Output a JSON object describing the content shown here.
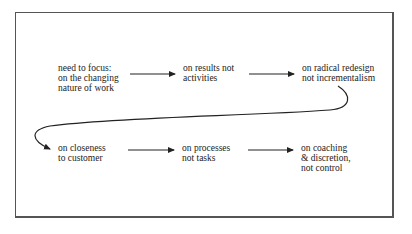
{
  "diagram": {
    "type": "flow",
    "rows": [
      {
        "nodes": [
          {
            "id": "n1",
            "lines": [
              "need to focus:",
              "on the changing",
              "nature of work"
            ]
          },
          {
            "id": "n2",
            "lines": [
              "on results not",
              "activities"
            ]
          },
          {
            "id": "n3",
            "lines": [
              "on radical redesign",
              "not incrementalism"
            ]
          }
        ]
      },
      {
        "nodes": [
          {
            "id": "n4",
            "lines": [
              "on closeness",
              "to customer"
            ]
          },
          {
            "id": "n5",
            "lines": [
              "on processes",
              "not tasks"
            ]
          },
          {
            "id": "n6",
            "lines": [
              "on coaching",
              "& discretion,",
              "not control"
            ]
          }
        ]
      }
    ],
    "edges": [
      {
        "from": "n1",
        "to": "n2",
        "style": "straight"
      },
      {
        "from": "n2",
        "to": "n3",
        "style": "straight"
      },
      {
        "from": "n3",
        "to": "n4",
        "style": "curved"
      },
      {
        "from": "n4",
        "to": "n5",
        "style": "straight"
      },
      {
        "from": "n5",
        "to": "n6",
        "style": "straight"
      }
    ],
    "colors": {
      "ink": "#222222",
      "frame": "#555555",
      "background": "#ffffff"
    }
  }
}
